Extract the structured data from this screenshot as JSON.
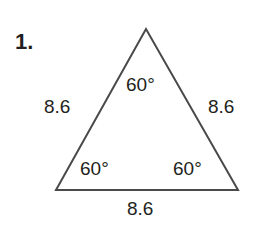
{
  "problem": {
    "number": "1.",
    "figure": "equilateral-triangle",
    "sides": {
      "left": "8.6",
      "right": "8.6",
      "bottom": "8.6"
    },
    "angles": {
      "top": "60°",
      "bottom_left": "60°",
      "bottom_right": "60°"
    },
    "colors": {
      "stroke": "#4a4a4a",
      "text": "#231f20"
    }
  }
}
